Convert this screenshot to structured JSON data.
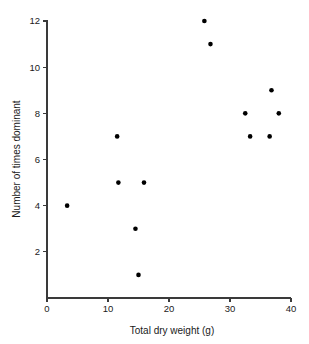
{
  "chart_data": {
    "type": "scatter",
    "title": "",
    "xlabel": "Total dry weight (g)",
    "ylabel": "Number of times dominant",
    "xlim": [
      0,
      40
    ],
    "ylim": [
      0,
      12.6
    ],
    "xticks": [
      0,
      10,
      20,
      30,
      40
    ],
    "xtick_labels": [
      "0",
      "10",
      "20",
      "30",
      "40"
    ],
    "yticks": [
      2,
      4,
      6,
      8,
      10,
      12
    ],
    "ytick_labels": [
      "2",
      "4",
      "6",
      "8",
      "10",
      "12"
    ],
    "grid": false,
    "legend": null,
    "marker": "filled-circle",
    "marker_color": "#000000",
    "marker_size_px": 4.6,
    "points": [
      {
        "x": 3.3,
        "y": 4
      },
      {
        "x": 11.5,
        "y": 7
      },
      {
        "x": 11.7,
        "y": 5
      },
      {
        "x": 14.5,
        "y": 3
      },
      {
        "x": 15.0,
        "y": 1
      },
      {
        "x": 15.9,
        "y": 5
      },
      {
        "x": 25.8,
        "y": 12
      },
      {
        "x": 26.8,
        "y": 11
      },
      {
        "x": 32.5,
        "y": 8
      },
      {
        "x": 33.3,
        "y": 7
      },
      {
        "x": 36.5,
        "y": 7
      },
      {
        "x": 36.8,
        "y": 9
      },
      {
        "x": 38.0,
        "y": 8
      }
    ]
  },
  "axes_geometry": {
    "origin_x_px": 47,
    "origin_y_px": 298,
    "x_end_px": 291,
    "y_top_px": 20,
    "y_value_at_top": 12.0,
    "y_top_value_px": 21,
    "tick_len_px": 4
  }
}
